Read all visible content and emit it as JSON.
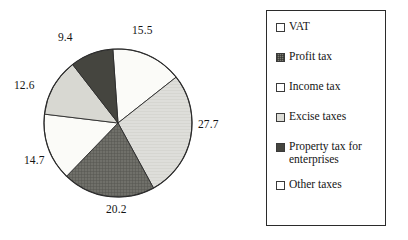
{
  "chart_data": {
    "type": "pie",
    "title": "",
    "labels": [
      "VAT",
      "Profit tax",
      "Income tax",
      "Excise taxes",
      "Property tax for enterprises",
      "Other taxes"
    ],
    "values": [
      15.5,
      27.7,
      20.2,
      14.7,
      12.6,
      9.4
    ],
    "value_labels": [
      "15.5",
      "27.7",
      "20.2",
      "14.7",
      "12.6",
      "9.4"
    ],
    "total": 100.1,
    "units": "percent",
    "start_angle_deg": -94,
    "direction": "clockwise",
    "legend": {
      "position": "right",
      "border": true,
      "entries": [
        {
          "label": "VAT",
          "swatch": "white",
          "fill": "#ffffff"
        },
        {
          "label": "Profit tax",
          "swatch": "dark-hatch",
          "fill": "#6a6a62"
        },
        {
          "label": "Income tax",
          "swatch": "white",
          "fill": "#ffffff"
        },
        {
          "label": "Excise taxes",
          "swatch": "light-gray",
          "fill": "#d8d8d2"
        },
        {
          "label": "Property tax for\nenterprises",
          "swatch": "dark",
          "fill": "#43433d"
        },
        {
          "label": "Other taxes",
          "swatch": "white",
          "fill": "#ffffff"
        }
      ]
    },
    "slice_styles": [
      {
        "name": "VAT",
        "fill": "#fbfbf8"
      },
      {
        "name": "Profit tax",
        "fill": "#dedeD8"
      },
      {
        "name": "Income tax",
        "fill": "#70706a"
      },
      {
        "name": "Excise taxes",
        "fill": "#fbfbf8"
      },
      {
        "name": "Property tax for enterprises",
        "fill": "#d8d8d2"
      },
      {
        "name": "Other taxes",
        "fill": "#45453f"
      }
    ],
    "grid": false,
    "xlabel": "",
    "ylabel": ""
  },
  "labels_positions": [
    {
      "text": "15.5",
      "x": 132,
      "y": 24
    },
    {
      "text": "27.7",
      "x": 198,
      "y": 118
    },
    {
      "text": "20.2",
      "x": 106,
      "y": 203
    },
    {
      "text": "14.7",
      "x": 24,
      "y": 154
    },
    {
      "text": "12.6",
      "x": 14,
      "y": 79
    },
    {
      "text": "9.4",
      "x": 58,
      "y": 31
    }
  ]
}
